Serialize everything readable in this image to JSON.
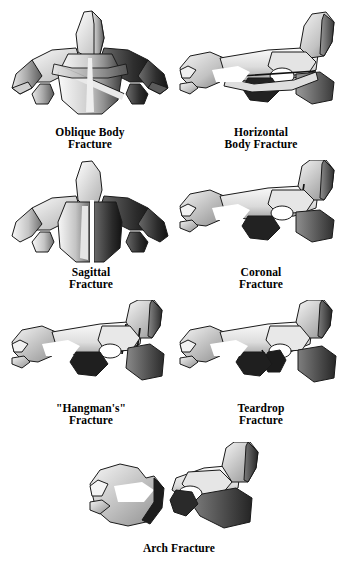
{
  "figure": {
    "background_color": "#ffffff",
    "ink_color": "#000000",
    "style": "grayscale anatomical line illustration",
    "bottom_cut_text": ""
  },
  "panels": [
    {
      "id": "oblique-body",
      "caption": "Oblique Body\nFracture",
      "view": "posterosuperior",
      "fracture_line": "oblique through vertebral body"
    },
    {
      "id": "horizontal-body",
      "caption": "Horizontal\nBody Fracture",
      "view": "lateral",
      "fracture_line": "horizontal through vertebral body"
    },
    {
      "id": "sagittal",
      "caption": "Sagittal\nFracture",
      "view": "posterosuperior",
      "fracture_line": "vertical midline sagittal split"
    },
    {
      "id": "coronal",
      "caption": "Coronal\nFracture",
      "view": "lateral",
      "fracture_line": "coronal plane through body"
    },
    {
      "id": "hangmans",
      "caption": "\"Hangman's\"\nFracture",
      "view": "lateral",
      "fracture_line": "bilateral pars interarticularis"
    },
    {
      "id": "teardrop",
      "caption": "Teardrop\nFracture",
      "view": "lateral",
      "fracture_line": "anteroinferior body fragment"
    },
    {
      "id": "arch",
      "caption": "Arch Fracture",
      "view": "lateral",
      "fracture_line": "posterior arch, fragments separated"
    }
  ],
  "palette": {
    "outline": "#1a1a1a",
    "bone_light": "#f2f2f2",
    "bone_mid": "#c9c9c9",
    "bone_shadow": "#8a8a8a",
    "bone_dark": "#4a4a4a",
    "bone_darkest": "#1f1f1f"
  }
}
